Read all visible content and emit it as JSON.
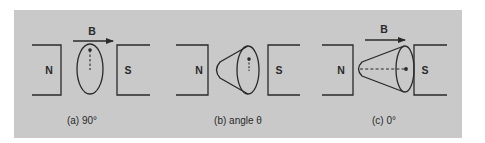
{
  "figure": {
    "background_color": "#c9c9c9",
    "line_color": "#2a2a2a",
    "field_label": "B",
    "panels": [
      {
        "id": "a",
        "caption": "(a) 90°",
        "north_label": "N",
        "south_label": "S",
        "shows_field_arrow": true,
        "shape": "ellipse"
      },
      {
        "id": "b",
        "caption": "(b) angle θ",
        "north_label": "N",
        "south_label": "S",
        "shows_field_arrow": false,
        "shape": "cone-tilted"
      },
      {
        "id": "c",
        "caption": "(c) 0°",
        "north_label": "N",
        "south_label": "S",
        "shows_field_arrow": true,
        "shape": "cone-aligned"
      }
    ]
  }
}
